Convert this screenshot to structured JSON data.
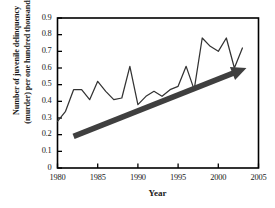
{
  "chart_data": {
    "type": "line",
    "title": "",
    "xlabel": "Year",
    "ylabel": "Number of juvenile delinquency (murder) per one hundred thousands",
    "ylabel_line1": "Number of juvenile delinquency",
    "ylabel_line2": "(murder) per one hundred thousands",
    "xlim": [
      1980,
      2005
    ],
    "ylim": [
      0,
      0.9
    ],
    "grid": false,
    "legend": "none",
    "xticks": [
      "1980",
      "1985",
      "1990",
      "1995",
      "2000",
      "2005"
    ],
    "xtick_values": [
      1980,
      1985,
      1990,
      1995,
      2000,
      2005
    ],
    "yticks": [
      "0",
      "0.1",
      "0.2",
      "0.3",
      "0.4",
      "0.5",
      "0.6",
      "0.7",
      "0.8",
      "0.9"
    ],
    "ytick_values": [
      0,
      0.1,
      0.2,
      0.3,
      0.4,
      0.5,
      0.6,
      0.7,
      0.8,
      0.9
    ],
    "x": [
      1980,
      1981,
      1982,
      1983,
      1984,
      1985,
      1986,
      1987,
      1988,
      1989,
      1990,
      1991,
      1992,
      1993,
      1994,
      1995,
      1996,
      1997,
      1998,
      1999,
      2000,
      2001,
      2002,
      2003
    ],
    "values": [
      0.28,
      0.34,
      0.47,
      0.47,
      0.41,
      0.52,
      0.46,
      0.41,
      0.42,
      0.61,
      0.38,
      0.43,
      0.46,
      0.43,
      0.47,
      0.49,
      0.61,
      0.47,
      0.78,
      0.73,
      0.7,
      0.78,
      0.6,
      0.72
    ],
    "series_color": "#333333",
    "annotations": [
      {
        "name": "trend-arrow",
        "type": "arrow",
        "x_start": 1982,
        "y_start": 0.19,
        "x_end": 2003.5,
        "y_end": 0.6,
        "color": "#3f3f3f"
      }
    ]
  },
  "axis": {
    "frame_color": "#000000",
    "tick_color": "#000000"
  }
}
